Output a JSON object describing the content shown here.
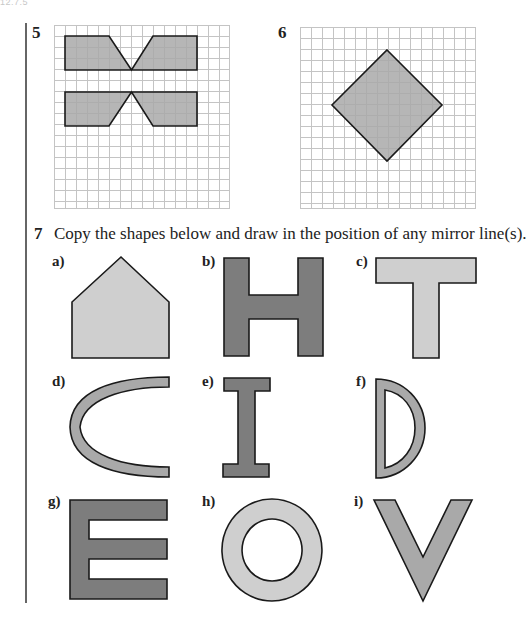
{
  "page_header": "12.7.5",
  "questions": {
    "q5": {
      "number": "5"
    },
    "q6": {
      "number": "6"
    },
    "q7": {
      "number": "7",
      "text": "Copy the shapes below and draw in the position of any mirror line(s).",
      "parts": [
        {
          "label": "a)",
          "shape": "pentagon-house"
        },
        {
          "label": "b)",
          "shape": "letter-H"
        },
        {
          "label": "c)",
          "shape": "letter-T"
        },
        {
          "label": "d)",
          "shape": "arc-C"
        },
        {
          "label": "e)",
          "shape": "letter-I"
        },
        {
          "label": "f)",
          "shape": "letter-D"
        },
        {
          "label": "g)",
          "shape": "letter-E"
        },
        {
          "label": "h)",
          "shape": "ring-O"
        },
        {
          "label": "i)",
          "shape": "letter-V"
        }
      ]
    }
  },
  "colors": {
    "grid_line": "#c4c4c4",
    "outline": "#1a1a1a",
    "fill_medium": "#a9a9a9",
    "fill_dark": "#7d7d7d",
    "fill_light": "#cfcfcf"
  }
}
